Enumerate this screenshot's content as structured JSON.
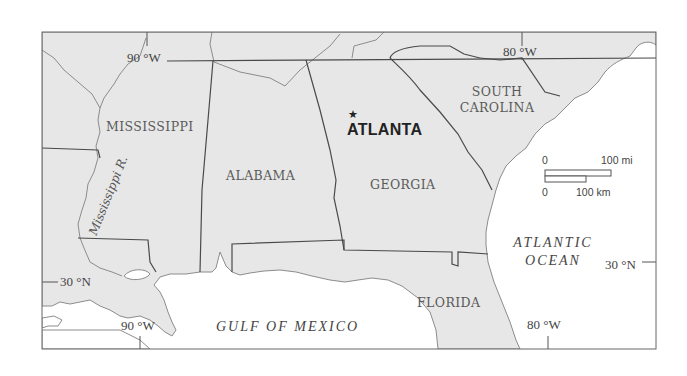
{
  "map": {
    "colors": {
      "land": "#e7e7e7",
      "water": "#ffffff",
      "border": "#4a4a4a",
      "coast": "#8c8c8c",
      "frame": "#666666"
    },
    "states": [
      {
        "name": "MISSISSIPPI"
      },
      {
        "name": "ALABAMA"
      },
      {
        "name": "GEORGIA"
      },
      {
        "name": "SOUTH",
        "name2": "CAROLINA"
      },
      {
        "name": "FLORIDA"
      }
    ],
    "city": {
      "name": "ATLANTA",
      "marker": "star-icon"
    },
    "water_bodies": {
      "gulf": "GULF OF MEXICO",
      "atlantic_line1": "ATLANTIC",
      "atlantic_line2": "OCEAN"
    },
    "river": {
      "name": "Mississippi R."
    },
    "coordinates": {
      "top_90w": "90 °W",
      "top_80w": "80 °W",
      "bottom_90w": "90 °W",
      "bottom_80w": "80 °W",
      "left_30n": "30 °N",
      "right_30n": "30 °N"
    },
    "scale_bar": {
      "mi_zero": "0",
      "mi_label": "100 mi",
      "km_zero": "0",
      "km_label": "100 km"
    }
  }
}
